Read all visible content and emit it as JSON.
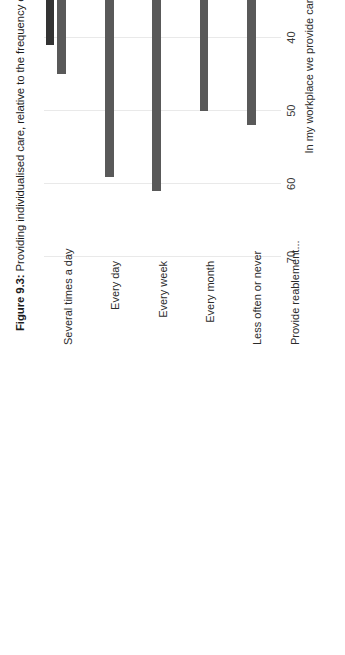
{
  "figure": {
    "label": "Figure 9.3:",
    "caption": "Providing individualised care, relative to the frequency of providing reablement. Home care workers, per cent"
  },
  "chart_data": {
    "type": "bar",
    "orientation": "horizontal",
    "title": "Figure 9.3: Providing individualised care, relative to the frequency of providing reablement. Home care workers, per cent",
    "xlabel": "In my workplace we provide care according to individual needs",
    "ylabel": "Provide reablement...",
    "categories": [
      "Several times a day",
      "Every day",
      "Every week",
      "Every month",
      "Less often or never"
    ],
    "series": [
      {
        "name": "series-1",
        "color": "#333333",
        "values": [
          41,
          24,
          30,
          19,
          24
        ]
      },
      {
        "name": "series-2",
        "color": "#595959",
        "values": [
          45,
          59,
          61,
          50,
          52
        ]
      },
      {
        "name": "series-3",
        "color": "#b0b0b0",
        "values": [
          13,
          15,
          3,
          25,
          24
        ]
      },
      {
        "name": "series-4",
        "color": "#e2e2e2",
        "values": [
          1,
          2,
          3,
          5,
          0
        ]
      }
    ],
    "xlim": [
      0,
      70
    ],
    "ticks": [
      "0",
      "10",
      "20",
      "30",
      "40",
      "50",
      "60",
      "70"
    ],
    "tick_values": [
      0,
      10,
      20,
      30,
      40,
      50,
      60,
      70
    ],
    "grid": true,
    "legend": "none",
    "value_unit": "per cent"
  }
}
